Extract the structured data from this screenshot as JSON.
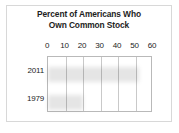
{
  "chart_data": {
    "type": "bar",
    "orientation": "horizontal",
    "title": "Percent of Americans Who Own Common Stock",
    "title_lines": [
      "Percent of Americans Who",
      "Own Common Stock"
    ],
    "categories": [
      "2011",
      "1979"
    ],
    "values": [
      50,
      18
    ],
    "series": [
      {
        "name": "Percent owning common stock",
        "values": [
          50,
          18
        ]
      }
    ],
    "xlabel": "",
    "ylabel": "",
    "xlim": [
      0,
      60
    ],
    "xticks": [
      0,
      10,
      20,
      30,
      40,
      50,
      60
    ],
    "xtick_labels": [
      "0",
      "10",
      "20",
      "30",
      "40",
      "50",
      "60"
    ],
    "grid": true,
    "grid_axis": "x",
    "legend": false,
    "bar_color": "#706f6f",
    "grid_color": "#c9c9c9",
    "axis_color": "#b9b9b9",
    "frame_color": "#d8d8d8",
    "text_color": "#1d1d1d",
    "background": "#ffffff"
  }
}
